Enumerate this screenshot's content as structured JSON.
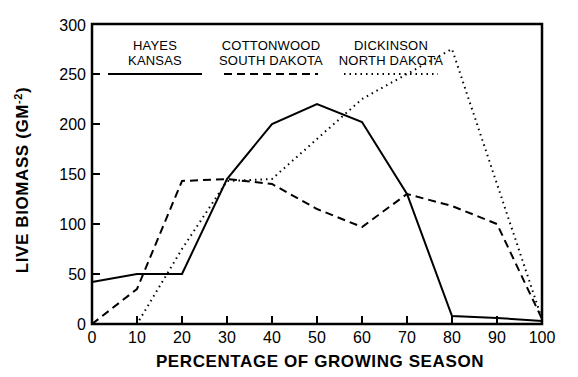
{
  "chart_data": {
    "type": "line",
    "title": "",
    "xlabel": "PERCENTAGE OF GROWING SEASON",
    "ylabel": "LIVE BIOMASS (GM-2)",
    "ylabel_main": "LIVE BIOMASS (GM",
    "ylabel_sup": "-2",
    "ylabel_tail": ")",
    "x": [
      0,
      10,
      20,
      30,
      40,
      50,
      60,
      70,
      80,
      90,
      100
    ],
    "xlim": [
      0,
      100
    ],
    "ylim": [
      0,
      300
    ],
    "xticks": [
      0,
      10,
      20,
      30,
      40,
      50,
      60,
      70,
      80,
      90,
      100
    ],
    "yticks": [
      0,
      50,
      100,
      150,
      200,
      250,
      300
    ],
    "xtick_labels": [
      "0",
      "10",
      "20",
      "30",
      "40",
      "50",
      "60",
      "70",
      "80",
      "90",
      "100"
    ],
    "ytick_labels": [
      "0",
      "50",
      "100",
      "150",
      "200",
      "250",
      "300"
    ],
    "grid": false,
    "legend_position": "top-inside",
    "series": [
      {
        "name": "HAYES KANSAS",
        "name_line1": "HAYES",
        "name_line2": "KANSAS",
        "style": "solid",
        "color": "#000000",
        "values": [
          42,
          50,
          50,
          145,
          200,
          220,
          202,
          130,
          8,
          6,
          3
        ]
      },
      {
        "name": "COTTONWOOD SOUTH DAKOTA",
        "name_line1": "COTTONWOOD",
        "name_line2": "SOUTH DAKOTA",
        "style": "dashed",
        "color": "#000000",
        "values": [
          0,
          35,
          143,
          145,
          140,
          115,
          97,
          130,
          118,
          100,
          5
        ]
      },
      {
        "name": "DICKINSON NORTH DAKOTA",
        "name_line1": "DICKINSON",
        "name_line2": "NORTH DAKOTA",
        "style": "dotted",
        "color": "#000000",
        "values": [
          0,
          0,
          75,
          143,
          145,
          185,
          225,
          250,
          275,
          140,
          5
        ]
      }
    ]
  }
}
